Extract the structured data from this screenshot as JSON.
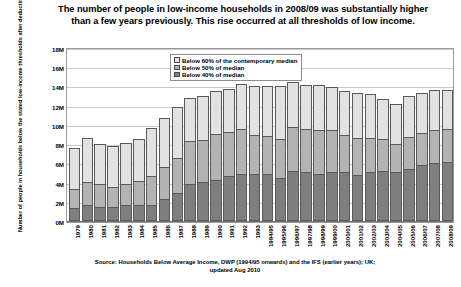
{
  "chart_data": {
    "type": "bar",
    "subtype": "stacked-column",
    "title": "The number of people in low-income households in 2008/09 was substantially higher than a few years previously.  This rise occurred at all thresholds of low income.",
    "xlabel": "",
    "ylabel": "Number of people in households below the stated low-income thresholds after deducting housing costs (millions)",
    "ylim": [
      0,
      18
    ],
    "yticks": [
      "0M",
      "2M",
      "4M",
      "6M",
      "8M",
      "10M",
      "12M",
      "14M",
      "16M",
      "18M"
    ],
    "ytick_values": [
      0,
      2,
      4,
      6,
      8,
      10,
      12,
      14,
      16,
      18
    ],
    "units": "millions of people",
    "grid": true,
    "legend_position": "top-center-inside",
    "categories": [
      "1979",
      "1980",
      "1981",
      "1982",
      "1983",
      "1984",
      "1985",
      "1986",
      "1987",
      "1988",
      "1989",
      "1990",
      "1991",
      "1992",
      "1993",
      "1994/95",
      "1995/96",
      "1996/97",
      "1997/98",
      "1998/99",
      "1999/00",
      "2000/01",
      "2001/02",
      "2002/03",
      "2003/04",
      "2004/05",
      "2005/06",
      "2006/07",
      "2007/08",
      "2008/09"
    ],
    "series": [
      {
        "name": "Below 40% of median",
        "color": "#7f7f7f",
        "values": [
          1.4,
          1.7,
          1.5,
          1.5,
          1.7,
          1.7,
          1.7,
          2.3,
          2.9,
          3.9,
          4.1,
          4.3,
          4.7,
          4.9,
          4.9,
          4.9,
          4.5,
          5.2,
          5.1,
          4.9,
          5.1,
          5.1,
          4.8,
          5.1,
          5.2,
          5.1,
          5.4,
          5.8,
          6.0,
          6.1
        ]
      },
      {
        "name": "Below 50% of median",
        "color": "#b3b3b3",
        "values": [
          3.3,
          4.1,
          3.8,
          3.5,
          3.9,
          4.2,
          4.7,
          5.6,
          6.6,
          8.3,
          8.4,
          9.1,
          9.3,
          9.6,
          8.9,
          8.8,
          8.5,
          9.8,
          9.6,
          9.5,
          9.5,
          9.0,
          8.6,
          8.6,
          8.5,
          8.0,
          8.7,
          9.2,
          9.5,
          9.6
        ]
      },
      {
        "name": "Below 60% of the contemporary median",
        "color": "#e2e2e2",
        "values": [
          7.6,
          8.6,
          8.0,
          7.8,
          8.1,
          8.5,
          9.7,
          10.7,
          11.9,
          12.8,
          13.0,
          13.5,
          13.7,
          14.3,
          14.0,
          14.0,
          14.0,
          14.5,
          14.2,
          14.1,
          13.9,
          13.5,
          13.3,
          13.2,
          12.7,
          12.2,
          13.0,
          13.3,
          13.6,
          13.6
        ]
      }
    ],
    "legend": [
      {
        "label": "Below 60% of the contemporary median",
        "color": "#e2e2e2"
      },
      {
        "label": "Below 50% of median",
        "color": "#b3b3b3"
      },
      {
        "label": "Below 40% of median",
        "color": "#7f7f7f"
      }
    ],
    "source_lines": [
      "Source: Households Below Average Income, DWP (1994/95 onwards) and the IFS (earlier years); UK;",
      "updated Aug 2010"
    ]
  }
}
